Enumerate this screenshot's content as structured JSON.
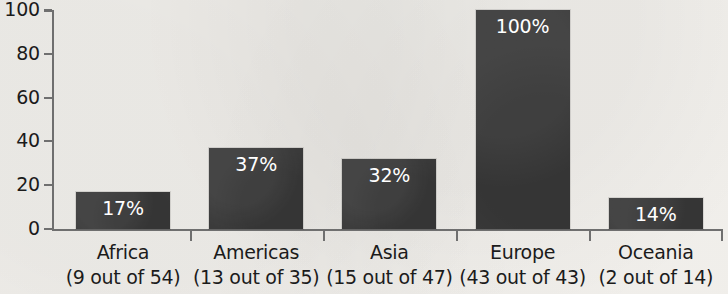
{
  "chart_data": {
    "type": "bar",
    "title": "",
    "subtitle": "",
    "xlabel": "",
    "ylabel": "",
    "ylim": [
      0,
      100
    ],
    "yticks": [
      0,
      20,
      40,
      60,
      80,
      100
    ],
    "grid": false,
    "legend": "none",
    "bar_color": "#3b3b3b",
    "background_color": "#f6f4f0",
    "text_color": "#1b1b1b",
    "value_label_color": "#ffffff",
    "axis_color": "#6f6f6f",
    "categories": [
      "Africa",
      "Americas",
      "Asia",
      "Europe",
      "Oceania"
    ],
    "category_sublabels": [
      "(9 out of 54)",
      "(13 out of 35)",
      "(15 out of 47)",
      "(43 out of 43)",
      "(2 out of 14)"
    ],
    "values": [
      17,
      37,
      32,
      100,
      14
    ],
    "value_labels": [
      "17%",
      "37%",
      "32%",
      "100%",
      "14%"
    ],
    "counts": [
      {
        "numerator": 9,
        "denominator": 54
      },
      {
        "numerator": 13,
        "denominator": 35
      },
      {
        "numerator": 15,
        "denominator": 47
      },
      {
        "numerator": 43,
        "denominator": 43
      },
      {
        "numerator": 2,
        "denominator": 14
      }
    ],
    "ytick_labels": [
      "0",
      "20",
      "40",
      "60",
      "80",
      "100"
    ]
  }
}
